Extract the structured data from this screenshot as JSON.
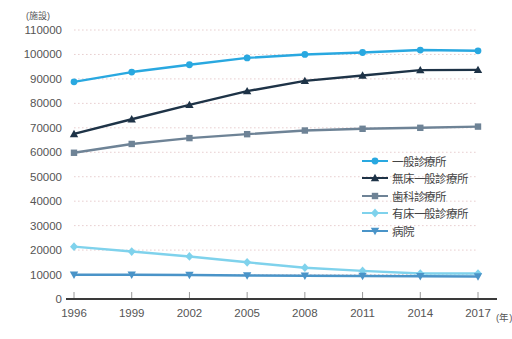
{
  "chart_data": {
    "type": "line",
    "title": "",
    "xlabel": "(年)",
    "ylabel": "(施設)",
    "unit_note": "(施設)",
    "x_unit": "(年)",
    "categories": [
      "1996",
      "1999",
      "2002",
      "2005",
      "2008",
      "2011",
      "2014",
      "2017"
    ],
    "x": [
      1996,
      1999,
      2002,
      2005,
      2008,
      2011,
      2014,
      2017
    ],
    "ylim": [
      0,
      110000
    ],
    "ytick_step": 10000,
    "ytick_labels": [
      "0",
      "10000",
      "20000",
      "30000",
      "40000",
      "50000",
      "60000",
      "70000",
      "80000",
      "90000",
      "100000",
      "110000"
    ],
    "ytick_values": [
      0,
      10000,
      20000,
      30000,
      40000,
      50000,
      60000,
      70000,
      80000,
      90000,
      100000,
      110000
    ],
    "grid": true,
    "legend_position": "right-middle",
    "series": [
      {
        "name": "一般診療所",
        "marker": "circle",
        "color": "#29a8e0",
        "values": [
          88800,
          92800,
          95800,
          98600,
          100000,
          100800,
          101800,
          101500
        ]
      },
      {
        "name": "無床一般診療所",
        "marker": "triangle-up",
        "color": "#1e3347",
        "values": [
          67500,
          73500,
          79400,
          85000,
          89200,
          91400,
          93600,
          93700
        ]
      },
      {
        "name": "歯科診療所",
        "marker": "square",
        "color": "#6e8396",
        "values": [
          59800,
          63400,
          65800,
          67400,
          68900,
          69600,
          70000,
          70500
        ]
      },
      {
        "name": "有床一般診療所",
        "marker": "diamond",
        "color": "#7fd2ec",
        "values": [
          21400,
          19400,
          17400,
          15000,
          12800,
          11500,
          10400,
          10400
        ]
      },
      {
        "name": "病院",
        "marker": "triangle-down",
        "color": "#4a94c8",
        "values": [
          9900,
          9900,
          9800,
          9600,
          9500,
          9400,
          9300,
          9200
        ]
      }
    ]
  },
  "legend": {
    "items": [
      {
        "label": "一般診療所"
      },
      {
        "label": "無床一般診療所"
      },
      {
        "label": "歯科診療所"
      },
      {
        "label": "有床一般診療所"
      },
      {
        "label": "病院"
      }
    ]
  },
  "axes": {
    "y_unit_label": "(施設)",
    "x_unit_label": "(年)"
  }
}
